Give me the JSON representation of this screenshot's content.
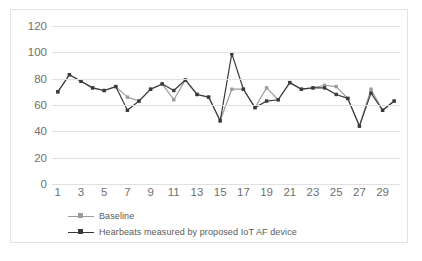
{
  "chart_data": {
    "type": "line",
    "title": "",
    "xlabel": "",
    "ylabel": "",
    "ylim": [
      0,
      120
    ],
    "ytick_values": [
      0,
      20,
      40,
      60,
      80,
      100,
      120
    ],
    "ytick_labels": [
      "0",
      "20",
      "40",
      "60",
      "80",
      "100",
      "120"
    ],
    "grid": true,
    "legend_position": "bottom-left",
    "x": [
      1,
      2,
      3,
      4,
      5,
      6,
      7,
      8,
      9,
      10,
      11,
      12,
      13,
      14,
      15,
      16,
      17,
      18,
      19,
      20,
      21,
      22,
      23,
      24,
      25,
      26,
      27,
      28,
      29,
      30
    ],
    "xtick_labels": [
      "1",
      "3",
      "5",
      "7",
      "9",
      "11",
      "13",
      "15",
      "17",
      "19",
      "21",
      "23",
      "25",
      "27",
      "29"
    ],
    "series": [
      {
        "name": "Baseline",
        "color": "#9c9c9c",
        "marker": "square",
        "values": [
          70,
          83,
          78,
          73,
          71,
          74,
          66,
          63,
          72,
          76,
          64,
          79,
          68,
          66,
          48,
          72,
          72,
          58,
          73,
          64,
          77,
          72,
          73,
          75,
          74,
          65,
          44,
          72,
          56,
          63
        ]
      },
      {
        "name": "Hearbeats measured by proposed IoT AF device",
        "color": "#3a3a3a",
        "marker": "square",
        "values": [
          70,
          83,
          78,
          73,
          71,
          74,
          56,
          63,
          72,
          76,
          71,
          79,
          68,
          66,
          48,
          99,
          72,
          58,
          63,
          64,
          77,
          72,
          73,
          73,
          68,
          65,
          44,
          69,
          56,
          63
        ]
      }
    ]
  },
  "legend": {
    "items": [
      {
        "label": "Baseline",
        "color": "#9c9c9c"
      },
      {
        "label": "Hearbeats measured by proposed IoT AF device",
        "color": "#3a3a3a"
      }
    ]
  },
  "colors": {
    "baseline": "#9c9c9c",
    "iot_device": "#3a3a3a",
    "gridline": "#e0e0e0",
    "border": "#e3e3e3",
    "tick_text": "#6f6f6f",
    "legend_text": "#5a5a5a",
    "background": "#ffffff"
  }
}
